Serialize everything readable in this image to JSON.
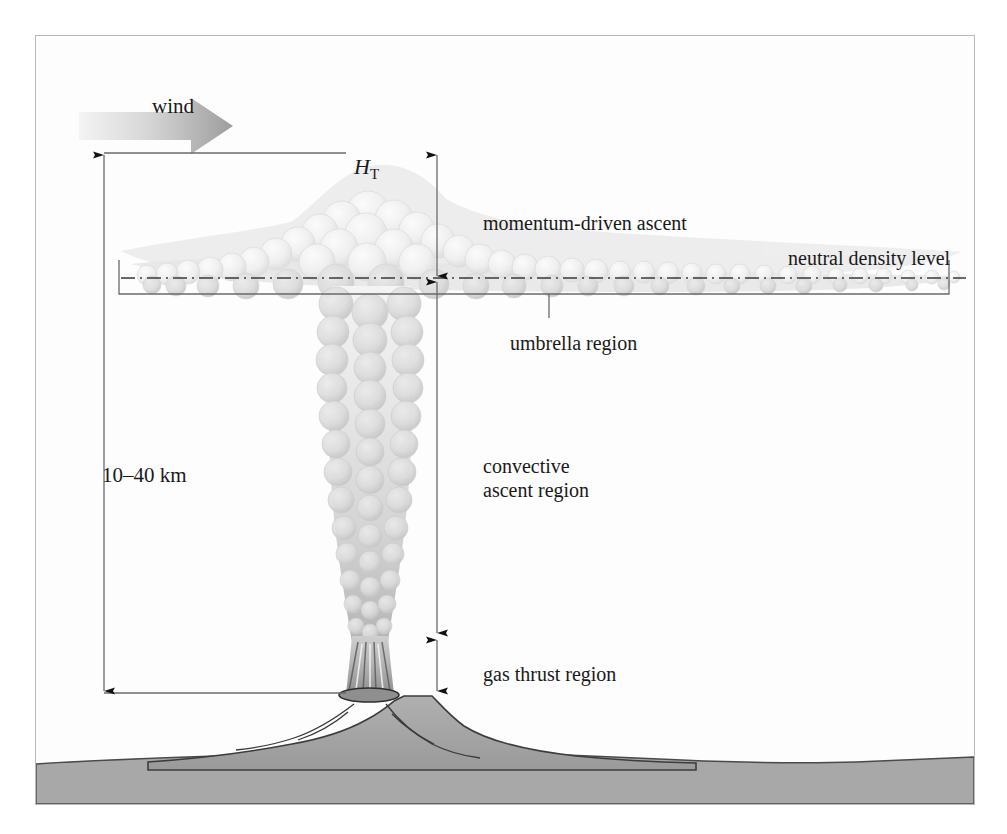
{
  "figure": {
    "type": "diagram",
    "background_color": "#fdfdfd",
    "frame_color": "#b9b9b9"
  },
  "labels": {
    "wind": "wind",
    "total_height": "H",
    "total_height_subscript": "T",
    "momentum_ascent": "momentum-driven ascent",
    "neutral_density": "neutral density level",
    "umbrella": "umbrella region",
    "convective_line1": "convective",
    "convective_line2": "ascent region",
    "gas_thrust": "gas thrust region",
    "scale": "10–40 km"
  },
  "regions": [
    {
      "name": "momentum-driven ascent",
      "label": "momentum-driven ascent"
    },
    {
      "name": "umbrella region",
      "label": "umbrella region"
    },
    {
      "name": "convective ascent region",
      "label": "convective ascent region"
    },
    {
      "name": "gas thrust region",
      "label": "gas thrust region"
    }
  ],
  "measurements": {
    "column_height_range": "10–40 km",
    "height_symbol": "H_T"
  },
  "colors": {
    "plume_light": "#f2f2f2",
    "plume_mid": "#e2e2e2",
    "plume_dark": "#c9c9c9",
    "ground": "#a8a8a8",
    "volcano": "#9e9e9e",
    "line": "#555555",
    "text": "#1a1a1a",
    "wind_arrow_start": "#f0f0f0",
    "wind_arrow_end": "#9a9a9a"
  }
}
